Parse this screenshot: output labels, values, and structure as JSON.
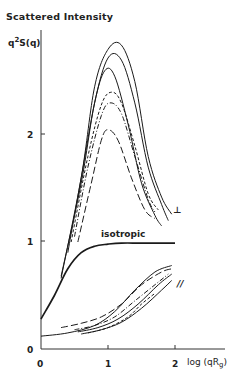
{
  "chart_data": {
    "type": "line",
    "title": "Scattered Intensity",
    "ylabel": "q²S(q)",
    "xlabel": "log (qRg)",
    "xlim": [
      0,
      2.2
    ],
    "ylim": [
      0,
      3
    ],
    "x_ticks": [
      "0",
      "1",
      "2"
    ],
    "y_ticks": [
      "0",
      "1",
      "2"
    ],
    "grid": false,
    "legend": "none",
    "annotations": [
      {
        "text": "isotropic",
        "x": 1.0,
        "y": 1.03
      },
      {
        "text": "⊥",
        "x": 2.1,
        "y": 1.3
      },
      {
        "text": "//",
        "x": 2.1,
        "y": 0.68
      }
    ],
    "series": [
      {
        "name": "isotropic",
        "style": "solid-thick",
        "x": [
          0.0,
          0.2,
          0.4,
          0.6,
          0.8,
          1.0,
          1.2,
          1.5,
          2.0
        ],
        "y": [
          0.28,
          0.5,
          0.75,
          0.9,
          0.96,
          0.98,
          0.99,
          0.99,
          0.99
        ]
      },
      {
        "name": "perpendicular-1",
        "style": "solid",
        "x": [
          0.3,
          0.6,
          0.8,
          1.0,
          1.2,
          1.4,
          1.6,
          1.8,
          1.95
        ],
        "y": [
          0.66,
          1.6,
          2.45,
          2.8,
          2.84,
          2.5,
          1.8,
          1.42,
          1.26
        ]
      },
      {
        "name": "perpendicular-2",
        "style": "solid",
        "x": [
          0.3,
          0.6,
          0.8,
          1.0,
          1.2,
          1.4,
          1.6,
          1.8,
          1.9
        ],
        "y": [
          0.68,
          1.55,
          2.3,
          2.72,
          2.7,
          2.3,
          1.7,
          1.35,
          1.2
        ]
      },
      {
        "name": "perpendicular-3",
        "style": "solid",
        "x": [
          0.4,
          0.6,
          0.8,
          0.95,
          1.1,
          1.3,
          1.5,
          1.7,
          1.8
        ],
        "y": [
          0.9,
          1.6,
          2.3,
          2.6,
          2.55,
          2.1,
          1.55,
          1.25,
          1.15
        ]
      },
      {
        "name": "perpendicular-4",
        "style": "short-dash",
        "x": [
          0.45,
          0.7,
          0.9,
          1.05,
          1.2,
          1.4,
          1.6,
          1.75
        ],
        "y": [
          1.0,
          1.8,
          2.28,
          2.4,
          2.3,
          1.9,
          1.45,
          1.3
        ]
      },
      {
        "name": "perpendicular-5",
        "style": "dash-dot",
        "x": [
          0.5,
          0.7,
          0.9,
          1.03,
          1.2,
          1.4,
          1.6,
          1.7
        ],
        "y": [
          1.05,
          1.7,
          2.18,
          2.3,
          2.2,
          1.8,
          1.4,
          1.28
        ]
      },
      {
        "name": "perpendicular-6",
        "style": "long-dash",
        "x": [
          0.55,
          0.75,
          0.9,
          1.0,
          1.15,
          1.35,
          1.55,
          1.7
        ],
        "y": [
          1.0,
          1.55,
          1.95,
          2.05,
          1.95,
          1.6,
          1.3,
          1.22
        ]
      },
      {
        "name": "parallel-1",
        "style": "solid",
        "x": [
          0.0,
          0.4,
          0.8,
          1.1,
          1.4,
          1.7,
          1.95
        ],
        "y": [
          0.12,
          0.15,
          0.22,
          0.35,
          0.55,
          0.72,
          0.78
        ]
      },
      {
        "name": "parallel-2",
        "style": "long-dash",
        "x": [
          0.3,
          0.6,
          0.9,
          1.2,
          1.5,
          1.8,
          1.95
        ],
        "y": [
          0.2,
          0.24,
          0.3,
          0.42,
          0.6,
          0.72,
          0.75
        ]
      },
      {
        "name": "parallel-3",
        "style": "dash-dot",
        "x": [
          0.5,
          0.8,
          1.1,
          1.4,
          1.7,
          1.9
        ],
        "y": [
          0.18,
          0.22,
          0.3,
          0.45,
          0.6,
          0.7
        ]
      },
      {
        "name": "parallel-4",
        "style": "solid",
        "x": [
          0.55,
          0.85,
          1.15,
          1.45,
          1.75,
          1.95
        ],
        "y": [
          0.16,
          0.2,
          0.28,
          0.42,
          0.6,
          0.7
        ]
      },
      {
        "name": "parallel-5",
        "style": "solid",
        "x": [
          0.6,
          0.9,
          1.2,
          1.5,
          1.8,
          1.95
        ],
        "y": [
          0.14,
          0.18,
          0.25,
          0.38,
          0.55,
          0.64
        ]
      },
      {
        "name": "parallel-6",
        "style": "short-dash",
        "x": [
          0.7,
          1.0,
          1.3,
          1.5,
          1.7
        ],
        "y": [
          0.15,
          0.2,
          0.3,
          0.42,
          0.52
        ]
      }
    ]
  },
  "labels": {
    "title": "Scattered Intensity",
    "ylabel_q": "q",
    "ylabel_sup": "2",
    "ylabel_rest": "S(q)",
    "xlabel": "log (qR",
    "xlabel_sub": "g",
    "xlabel_close": ")",
    "isotropic": "isotropic",
    "perp": "⊥",
    "par": "//",
    "tick_x0": "0",
    "tick_x1": "1",
    "tick_x2": "2",
    "tick_y0": "0",
    "tick_y1": "1",
    "tick_y2": "2"
  }
}
